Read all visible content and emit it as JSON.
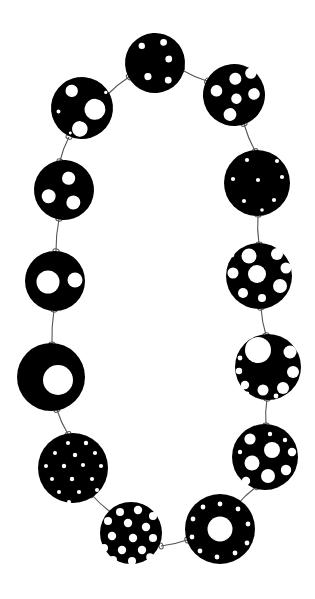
{
  "artwork": {
    "title": "Perforated Disc Necklace",
    "subject": "necklace of pierced black discs joined by wire links",
    "background_color": "#ffffff",
    "disc_color": "#000000",
    "hole_color": "#ffffff",
    "wire_color": "#555555",
    "canvas": {
      "width": 315,
      "height": 599
    },
    "disc_count": 13,
    "link_count": 13
  },
  "chart_data": {
    "type": "scatter",
    "xlabel": "",
    "ylabel": "",
    "xlim": [
      0,
      315
    ],
    "ylim": [
      0,
      599
    ],
    "grid": false,
    "legend": "none",
    "categories": [
      "disc-top",
      "disc-upper-left",
      "disc-upper-right",
      "disc-left-1",
      "disc-left-2",
      "disc-left-ring",
      "disc-left-speckled",
      "disc-bottom-left",
      "disc-bottom-right-ring",
      "disc-right-mixed",
      "disc-right-bigcircle",
      "disc-right-clustered",
      "disc-right-dotted"
    ],
    "values": [
      30,
      31,
      31,
      30,
      30,
      34,
      35,
      31,
      35,
      33,
      33,
      33,
      33
    ]
  },
  "discs": [
    {
      "id": "disc-top",
      "label": "Top disc — five small round holes",
      "cx": 155,
      "cy": 63,
      "r": 30,
      "rotate": -4,
      "holes": [
        {
          "cx": 143,
          "cy": 45,
          "r": 3.2
        },
        {
          "cx": 165,
          "cy": 43,
          "r": 3.4
        },
        {
          "cx": 169,
          "cy": 60,
          "r": 3.4
        },
        {
          "cx": 147,
          "cy": 76,
          "r": 3.6
        },
        {
          "cx": 167,
          "cy": 81,
          "r": 3.4
        }
      ]
    },
    {
      "id": "disc-upper-left",
      "label": "Upper-left disc — large hole with medium and tiny holes",
      "cx": 82,
      "cy": 108,
      "r": 31,
      "rotate": 6,
      "holes": [
        {
          "cx": 70,
          "cy": 92,
          "r": 6.2
        },
        {
          "cx": 95,
          "cy": 108,
          "r": 10.5
        },
        {
          "cx": 82,
          "cy": 129,
          "r": 7.8
        },
        {
          "cx": 59,
          "cy": 114,
          "r": 2.0
        },
        {
          "cx": 104,
          "cy": 90,
          "r": 1.7
        },
        {
          "cx": 73,
          "cy": 134,
          "r": 1.5
        }
      ]
    },
    {
      "id": "disc-upper-right",
      "label": "Upper-right disc — six medium round holes",
      "cx": 234,
      "cy": 95,
      "r": 31,
      "rotate": -6,
      "holes": [
        {
          "cx": 237,
          "cy": 79,
          "r": 6.0
        },
        {
          "cx": 253,
          "cy": 75,
          "r": 5.6
        },
        {
          "cx": 217,
          "cy": 89,
          "r": 5.8
        },
        {
          "cx": 236,
          "cy": 99,
          "r": 5.2
        },
        {
          "cx": 254,
          "cy": 96,
          "r": 5.8
        },
        {
          "cx": 228,
          "cy": 114,
          "r": 6.4
        }
      ]
    },
    {
      "id": "disc-left-1",
      "label": "Left disc — three round holes",
      "cx": 64,
      "cy": 190,
      "r": 30,
      "rotate": 3,
      "holes": [
        {
          "cx": 68,
          "cy": 178,
          "r": 6.6
        },
        {
          "cx": 49,
          "cy": 197,
          "r": 7.0
        },
        {
          "cx": 74,
          "cy": 202,
          "r": 7.0
        }
      ]
    },
    {
      "id": "disc-left-2",
      "label": "Left disc — one large hole and one medium hole",
      "cx": 55,
      "cy": 281,
      "r": 30,
      "rotate": 0,
      "holes": [
        {
          "cx": 48,
          "cy": 282,
          "r": 11.5
        },
        {
          "cx": 75,
          "cy": 280,
          "r": 7.5
        }
      ]
    },
    {
      "id": "disc-left-ring",
      "label": "Left ring disc — single large off-centre hole",
      "cx": 51,
      "cy": 377,
      "r": 34,
      "rotate": 0,
      "holes": [
        {
          "cx": 58,
          "cy": 380,
          "r": 15.0
        }
      ]
    },
    {
      "id": "disc-left-speckled",
      "label": "Left disc — sixteen tiny speckled holes",
      "cx": 73,
      "cy": 468,
      "r": 35,
      "rotate": 0,
      "holes": [
        {
          "cx": 68,
          "cy": 443,
          "r": 2.1
        },
        {
          "cx": 86,
          "cy": 443,
          "r": 2.2
        },
        {
          "cx": 55,
          "cy": 453,
          "r": 2.0
        },
        {
          "cx": 75,
          "cy": 455,
          "r": 2.2
        },
        {
          "cx": 95,
          "cy": 453,
          "r": 2.1
        },
        {
          "cx": 46,
          "cy": 466,
          "r": 2.0
        },
        {
          "cx": 64,
          "cy": 466,
          "r": 2.2
        },
        {
          "cx": 83,
          "cy": 465,
          "r": 2.1
        },
        {
          "cx": 101,
          "cy": 466,
          "r": 2.1
        },
        {
          "cx": 52,
          "cy": 479,
          "r": 2.0
        },
        {
          "cx": 72,
          "cy": 479,
          "r": 2.2
        },
        {
          "cx": 92,
          "cy": 479,
          "r": 2.1
        },
        {
          "cx": 59,
          "cy": 492,
          "r": 2.0
        },
        {
          "cx": 79,
          "cy": 492,
          "r": 2.1
        },
        {
          "cx": 97,
          "cy": 490,
          "r": 2.0
        },
        {
          "cx": 69,
          "cy": 502,
          "r": 2.0
        }
      ]
    },
    {
      "id": "disc-bottom-left",
      "label": "Bottom-left disc — many medium holes in rows",
      "cx": 131,
      "cy": 533,
      "r": 31,
      "rotate": 0,
      "holes": [
        {
          "cx": 120,
          "cy": 512,
          "r": 4.0
        },
        {
          "cx": 138,
          "cy": 510,
          "r": 4.2
        },
        {
          "cx": 153,
          "cy": 516,
          "r": 4.0
        },
        {
          "cx": 108,
          "cy": 521,
          "r": 4.0
        },
        {
          "cx": 128,
          "cy": 523,
          "r": 4.2
        },
        {
          "cx": 146,
          "cy": 527,
          "r": 4.2
        },
        {
          "cx": 112,
          "cy": 536,
          "r": 4.2
        },
        {
          "cx": 133,
          "cy": 538,
          "r": 4.2
        },
        {
          "cx": 153,
          "cy": 538,
          "r": 4.0
        },
        {
          "cx": 104,
          "cy": 548,
          "r": 4.0
        },
        {
          "cx": 122,
          "cy": 550,
          "r": 4.2
        },
        {
          "cx": 142,
          "cy": 550,
          "r": 4.2
        },
        {
          "cx": 113,
          "cy": 560,
          "r": 4.0
        },
        {
          "cx": 132,
          "cy": 561,
          "r": 4.0
        },
        {
          "cx": 150,
          "cy": 557,
          "r": 3.8
        },
        {
          "cx": 124,
          "cy": 568,
          "r": 3.6
        }
      ]
    },
    {
      "id": "disc-bottom-right-ring",
      "label": "Bottom-right ring disc — central hole with ring of small holes",
      "cx": 220,
      "cy": 529,
      "r": 35,
      "rotate": 0,
      "holes": [
        {
          "cx": 220,
          "cy": 529,
          "r": 12.5
        },
        {
          "cx": 220,
          "cy": 504,
          "r": 2.4
        },
        {
          "cx": 238,
          "cy": 509,
          "r": 2.4
        },
        {
          "cx": 248,
          "cy": 524,
          "r": 2.4
        },
        {
          "cx": 247,
          "cy": 543,
          "r": 2.4
        },
        {
          "cx": 235,
          "cy": 553,
          "r": 2.4
        },
        {
          "cx": 217,
          "cy": 557,
          "r": 2.4
        },
        {
          "cx": 200,
          "cy": 551,
          "r": 2.4
        },
        {
          "cx": 192,
          "cy": 537,
          "r": 2.4
        },
        {
          "cx": 193,
          "cy": 519,
          "r": 2.4
        },
        {
          "cx": 203,
          "cy": 507,
          "r": 2.4
        }
      ]
    },
    {
      "id": "disc-right-mixed",
      "label": "Right disc — assorted large and small holes",
      "cx": 265,
      "cy": 457,
      "r": 33,
      "rotate": 0,
      "holes": [
        {
          "cx": 250,
          "cy": 439,
          "r": 5.6
        },
        {
          "cx": 270,
          "cy": 434,
          "r": 2.2
        },
        {
          "cx": 285,
          "cy": 440,
          "r": 2.2
        },
        {
          "cx": 240,
          "cy": 452,
          "r": 2.2
        },
        {
          "cx": 272,
          "cy": 450,
          "r": 8.0
        },
        {
          "cx": 292,
          "cy": 452,
          "r": 4.2
        },
        {
          "cx": 252,
          "cy": 463,
          "r": 7.5
        },
        {
          "cx": 286,
          "cy": 470,
          "r": 5.2
        },
        {
          "cx": 268,
          "cy": 476,
          "r": 7.0
        },
        {
          "cx": 246,
          "cy": 481,
          "r": 4.2
        },
        {
          "cx": 288,
          "cy": 486,
          "r": 2.2
        }
      ]
    },
    {
      "id": "disc-right-bigcircle",
      "label": "Right disc — one large hole with arc of medium holes",
      "cx": 268,
      "cy": 367,
      "r": 33,
      "rotate": 0,
      "holes": [
        {
          "cx": 258,
          "cy": 350,
          "r": 13.0
        },
        {
          "cx": 290,
          "cy": 352,
          "r": 6.5
        },
        {
          "cx": 293,
          "cy": 372,
          "r": 6.0
        },
        {
          "cx": 283,
          "cy": 388,
          "r": 6.0
        },
        {
          "cx": 263,
          "cy": 390,
          "r": 5.5
        },
        {
          "cx": 245,
          "cy": 385,
          "r": 4.2
        },
        {
          "cx": 239,
          "cy": 371,
          "r": 3.2
        },
        {
          "cx": 240,
          "cy": 358,
          "r": 2.4
        },
        {
          "cx": 247,
          "cy": 394,
          "r": 2.4
        },
        {
          "cx": 276,
          "cy": 396,
          "r": 2.4
        }
      ]
    },
    {
      "id": "disc-right-clustered",
      "label": "Right disc — cluster of medium-large holes",
      "cx": 259,
      "cy": 276,
      "r": 33,
      "rotate": 0,
      "holes": [
        {
          "cx": 249,
          "cy": 256,
          "r": 7.5
        },
        {
          "cx": 277,
          "cy": 254,
          "r": 6.0
        },
        {
          "cx": 286,
          "cy": 268,
          "r": 5.5
        },
        {
          "cx": 233,
          "cy": 273,
          "r": 5.5
        },
        {
          "cx": 257,
          "cy": 274,
          "r": 9.0
        },
        {
          "cx": 280,
          "cy": 286,
          "r": 7.0
        },
        {
          "cx": 243,
          "cy": 293,
          "r": 5.0
        },
        {
          "cx": 262,
          "cy": 298,
          "r": 4.0
        },
        {
          "cx": 232,
          "cy": 255,
          "r": 2.4
        },
        {
          "cx": 289,
          "cy": 296,
          "r": 2.4
        }
      ]
    },
    {
      "id": "disc-right-dotted",
      "label": "Right disc — seven tiny dotted holes",
      "cx": 257,
      "cy": 183,
      "r": 33,
      "rotate": 0,
      "holes": [
        {
          "cx": 247,
          "cy": 160,
          "r": 2.1
        },
        {
          "cx": 277,
          "cy": 161,
          "r": 2.1
        },
        {
          "cx": 233,
          "cy": 179,
          "r": 2.1
        },
        {
          "cx": 258,
          "cy": 180,
          "r": 2.1
        },
        {
          "cx": 282,
          "cy": 177,
          "r": 2.1
        },
        {
          "cx": 244,
          "cy": 201,
          "r": 2.1
        },
        {
          "cx": 274,
          "cy": 200,
          "r": 2.1
        },
        {
          "cx": 262,
          "cy": 210,
          "r": 1.8
        }
      ]
    }
  ],
  "links": [
    {
      "id": "link-top-to-upper-left",
      "x1": 129,
      "y1": 77,
      "x2": 107,
      "y2": 95
    },
    {
      "id": "link-top-to-upper-right",
      "x1": 182,
      "y1": 70,
      "x2": 207,
      "y2": 81
    },
    {
      "id": "link-upper-left-to-left-1",
      "x1": 69,
      "y1": 137,
      "x2": 60,
      "y2": 161
    },
    {
      "id": "link-upper-right-to-right-dotted",
      "x1": 244,
      "y1": 124,
      "x2": 255,
      "y2": 151
    },
    {
      "id": "link-left-1-to-left-2",
      "x1": 59,
      "y1": 219,
      "x2": 56,
      "y2": 251
    },
    {
      "id": "link-right-dotted-to-clustered",
      "x1": 258,
      "y1": 215,
      "x2": 259,
      "y2": 244
    },
    {
      "id": "link-left-2-to-ring",
      "x1": 54,
      "y1": 310,
      "x2": 52,
      "y2": 344
    },
    {
      "id": "link-clustered-to-bigcircle",
      "x1": 261,
      "y1": 308,
      "x2": 266,
      "y2": 335
    },
    {
      "id": "link-ring-to-speckled",
      "x1": 57,
      "y1": 410,
      "x2": 68,
      "y2": 434
    },
    {
      "id": "link-bigcircle-to-mixed",
      "x1": 267,
      "y1": 399,
      "x2": 266,
      "y2": 425
    },
    {
      "id": "link-speckled-to-bottom-left",
      "x1": 92,
      "y1": 495,
      "x2": 112,
      "y2": 513
    },
    {
      "id": "link-mixed-to-bottom-right",
      "x1": 256,
      "y1": 487,
      "x2": 236,
      "y2": 506
    },
    {
      "id": "link-bottom-left-to-bottom-right",
      "x1": 161,
      "y1": 546,
      "x2": 187,
      "y2": 540
    }
  ]
}
